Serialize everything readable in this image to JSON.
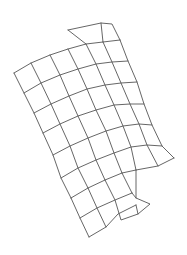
{
  "figure": {
    "width": 187,
    "height": 255,
    "background": "#ffffff",
    "line_color": "#555555",
    "line_width": 0.9
  },
  "mesh": {
    "rows": [
      [
        [
          14,
          73
        ],
        [
          31,
          63
        ],
        [
          50,
          55
        ],
        [
          68,
          49
        ],
        [
          86,
          44
        ],
        [
          103,
          42
        ],
        [
          120,
          40
        ]
      ],
      [
        [
          24,
          93
        ],
        [
          41,
          83
        ],
        [
          60,
          75
        ],
        [
          78,
          69
        ],
        [
          96,
          64
        ],
        [
          112,
          62
        ],
        [
          128,
          61
        ]
      ],
      [
        [
          34,
          113
        ],
        [
          51,
          104
        ],
        [
          69,
          96
        ],
        [
          87,
          89
        ],
        [
          105,
          85
        ],
        [
          121,
          83
        ],
        [
          137,
          82
        ]
      ],
      [
        [
          43,
          133
        ],
        [
          60,
          124
        ],
        [
          78,
          116
        ],
        [
          96,
          110
        ],
        [
          114,
          105
        ],
        [
          130,
          104
        ],
        [
          144,
          104
        ]
      ],
      [
        [
          53,
          155
        ],
        [
          70,
          146
        ],
        [
          88,
          138
        ],
        [
          106,
          131
        ],
        [
          123,
          126
        ],
        [
          139,
          124
        ],
        [
          152,
          125
        ]
      ],
      [
        [
          61,
          178
        ],
        [
          78,
          168
        ],
        [
          96,
          160
        ],
        [
          114,
          153
        ],
        [
          131,
          147
        ],
        [
          147,
          145
        ],
        [
          162,
          146
        ]
      ],
      [
        [
          71,
          198
        ],
        [
          88,
          188
        ],
        [
          105,
          180
        ],
        [
          122,
          173
        ],
        [
          136,
          170
        ],
        [
          158,
          166
        ],
        [
          174,
          158
        ]
      ]
    ],
    "extra_polylines": [
      [
        [
          68,
          30
        ],
        [
          101,
          23
        ],
        [
          112,
          24
        ],
        [
          120,
          40
        ]
      ],
      [
        [
          68,
          30
        ],
        [
          86,
          44
        ]
      ],
      [
        [
          101,
          23
        ],
        [
          103,
          42
        ]
      ],
      [
        [
          71,
          198
        ],
        [
          80,
          218
        ],
        [
          89,
          237
        ]
      ],
      [
        [
          80,
          218
        ],
        [
          97,
          208
        ],
        [
          115,
          200
        ],
        [
          132,
          193
        ]
      ],
      [
        [
          89,
          237
        ],
        [
          106,
          227
        ],
        [
          118,
          214
        ],
        [
          136,
          205
        ]
      ],
      [
        [
          88,
          188
        ],
        [
          97,
          208
        ],
        [
          106,
          227
        ]
      ],
      [
        [
          105,
          180
        ],
        [
          115,
          200
        ],
        [
          121,
          220
        ],
        [
          138,
          214
        ],
        [
          150,
          204
        ],
        [
          136,
          198
        ],
        [
          132,
          193
        ]
      ],
      [
        [
          122,
          173
        ],
        [
          132,
          193
        ]
      ],
      [
        [
          136,
          170
        ],
        [
          136,
          198
        ]
      ],
      [
        [
          136,
          205
        ],
        [
          138,
          214
        ]
      ]
    ]
  }
}
